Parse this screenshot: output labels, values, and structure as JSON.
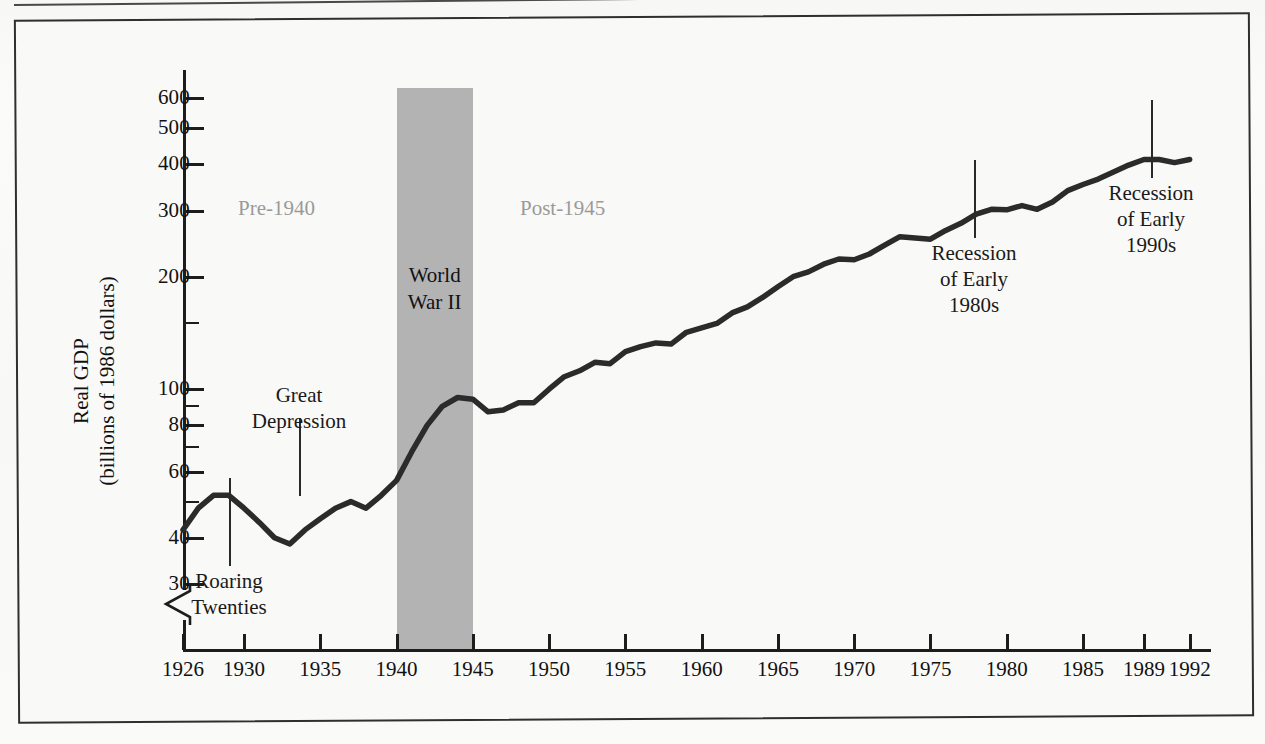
{
  "figure": {
    "type": "scanned-textbook-figure",
    "frame": "bordered-box"
  },
  "chart_data": {
    "type": "line",
    "title": "",
    "xlabel": "",
    "ylabel": "Real GDP (billions of 1986 dollars)",
    "ylabel_line1": "Real GDP",
    "ylabel_line2": "(billions of 1986 dollars)",
    "yscale": "log",
    "ylim": [
      28,
      680
    ],
    "xlim": [
      1926,
      1993
    ],
    "grid": false,
    "legend": null,
    "y_major_ticks": [
      30,
      40,
      60,
      80,
      100,
      200,
      300,
      400,
      500,
      600
    ],
    "y_tick_labels": [
      "30",
      "40",
      "60",
      "80",
      "100",
      "200",
      "300",
      "400",
      "500",
      "600"
    ],
    "y_minor_ticks": [
      50,
      70,
      90,
      150
    ],
    "x_ticks": [
      1926,
      1930,
      1935,
      1940,
      1945,
      1950,
      1955,
      1960,
      1965,
      1970,
      1975,
      1980,
      1985,
      1989,
      1992
    ],
    "x_tick_labels": [
      "1926",
      "1930",
      "1935",
      "1940",
      "1945",
      "1950",
      "1955",
      "1960",
      "1965",
      "1970",
      "1975",
      "1980",
      "1985",
      "1989",
      "1992"
    ],
    "axis_break": true,
    "series": [
      {
        "name": "Real GDP",
        "x": [
          1926,
          1927,
          1928,
          1929,
          1930,
          1931,
          1932,
          1933,
          1934,
          1935,
          1936,
          1937,
          1938,
          1939,
          1940,
          1941,
          1942,
          1943,
          1944,
          1945,
          1946,
          1947,
          1948,
          1949,
          1950,
          1951,
          1952,
          1953,
          1954,
          1955,
          1956,
          1957,
          1958,
          1959,
          1960,
          1961,
          1962,
          1963,
          1964,
          1965,
          1966,
          1967,
          1968,
          1969,
          1970,
          1971,
          1972,
          1973,
          1974,
          1975,
          1976,
          1977,
          1978,
          1979,
          1980,
          1981,
          1982,
          1983,
          1984,
          1985,
          1986,
          1987,
          1988,
          1989,
          1990,
          1991,
          1992
        ],
        "y": [
          42,
          48,
          52,
          52,
          48,
          44,
          40,
          38.5,
          42,
          45,
          48,
          50,
          48,
          52,
          57,
          68,
          80,
          90,
          95,
          94,
          87,
          88,
          92,
          92,
          100,
          108,
          112,
          118,
          117,
          126,
          130,
          133,
          132,
          142,
          146,
          150,
          160,
          166,
          176,
          188,
          200,
          206,
          216,
          223,
          222,
          230,
          243,
          256,
          254,
          252,
          266,
          278,
          294,
          303,
          302,
          310,
          303,
          317,
          340,
          353,
          365,
          381,
          398,
          412,
          412,
          404,
          412
        ]
      }
    ],
    "annotations": [
      {
        "id": "ww2-band",
        "label": "World War II",
        "type": "shaded-band",
        "x_start": 1940,
        "x_end": 1945,
        "color": "#b3b3b3"
      },
      {
        "id": "pre-1940",
        "label": "Pre-1940",
        "type": "era-label",
        "color": "#9a9a9a"
      },
      {
        "id": "post-1945",
        "label": "Post-1945",
        "type": "era-label",
        "color": "#9a9a9a"
      },
      {
        "id": "roaring-twenties",
        "label": "Roaring Twenties",
        "line1": "Roaring",
        "line2": "Twenties",
        "type": "callout",
        "points_to_year": 1928
      },
      {
        "id": "great-depression",
        "label": "Great Depression",
        "line1": "Great",
        "line2": "Depression",
        "type": "callout",
        "points_to_year": 1933
      },
      {
        "id": "recession-1980s",
        "label": "Recession of Early 1980s",
        "line1": "Recession",
        "line2": "of Early",
        "line3": "1980s",
        "type": "callout",
        "points_to_year": 1982
      },
      {
        "id": "recession-1990s",
        "label": "Recession of Early 1990s",
        "line1": "Recession",
        "line2": "of Early",
        "line3": "1990s",
        "type": "callout",
        "points_to_year": 1991
      }
    ]
  },
  "colors": {
    "line": "#2b2b2b",
    "band": "#b3b3b3",
    "axis": "#1d1d1d",
    "era_text": "#9a9a9a",
    "paper": "#f9f9f7",
    "frame": "#2f2f2f"
  }
}
